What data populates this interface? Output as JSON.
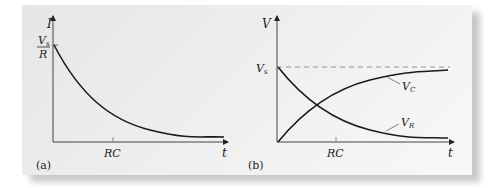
{
  "figure": {
    "panel_a": {
      "tag": "(a)",
      "y_axis_label": "I",
      "x_axis_label": "t",
      "y_intercept_numerator": "V",
      "y_intercept_numerator_sub": "s",
      "y_intercept_denominator": "R",
      "x_tick_label": "RC",
      "curve": "exponential decay"
    },
    "panel_b": {
      "tag": "(b)",
      "y_axis_label": "V",
      "x_axis_label": "t",
      "y_level_label": "V",
      "y_level_label_sub": "s",
      "x_tick_label": "RC",
      "curve_rising_label": "V",
      "curve_rising_label_sub": "C",
      "curve_falling_label": "V",
      "curve_falling_label_sub": "R",
      "asymptote": "dashed line at Vs"
    }
  },
  "colors": {
    "ink": "#222222",
    "panel_bg": "#ececec",
    "dashed": "#888888"
  }
}
